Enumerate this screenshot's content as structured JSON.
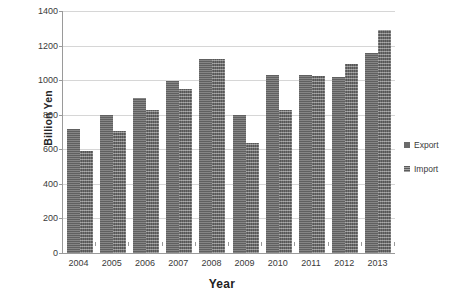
{
  "chart_data": {
    "type": "bar",
    "title": "",
    "xlabel": "Year",
    "ylabel": "Billion Yen",
    "categories": [
      "2004",
      "2005",
      "2006",
      "2007",
      "2008",
      "2009",
      "2010",
      "2011",
      "2012",
      "2013"
    ],
    "series": [
      {
        "name": "Export",
        "values": [
          720,
          798,
          895,
          998,
          1122,
          800,
          1032,
          1027,
          1020,
          1160
        ]
      },
      {
        "name": "Import",
        "values": [
          590,
          705,
          826,
          951,
          1122,
          637,
          825,
          1022,
          1092,
          1290
        ]
      }
    ],
    "ylim": [
      0,
      1400
    ],
    "yticks": [
      0,
      200,
      400,
      600,
      800,
      1000,
      1200,
      1400
    ],
    "ytick_labels": [
      "0",
      "200",
      "400",
      "600",
      "800",
      "1000",
      "1200",
      "1400"
    ],
    "grid": true,
    "legend_position": "right",
    "legend_entries": [
      "Export",
      "Import"
    ],
    "colors": {
      "export": "#6b6b6b",
      "import": "#707070",
      "gridline": "#d6d6d6",
      "axis": "#9a9a9a",
      "background": "#ffffff",
      "text": "#3a3a3a"
    }
  }
}
